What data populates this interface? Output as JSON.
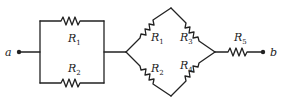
{
  "diagram": {
    "type": "circuit",
    "terminals": [
      {
        "id": "a",
        "label": "a"
      },
      {
        "id": "b",
        "label": "b"
      }
    ],
    "resistors": {
      "left_top": {
        "letter": "R",
        "sub": "1"
      },
      "left_bot": {
        "letter": "R",
        "sub": "2"
      },
      "dia_ul": {
        "letter": "R",
        "sub": "1"
      },
      "dia_ll": {
        "letter": "R",
        "sub": "2"
      },
      "dia_ur": {
        "letter": "R",
        "sub": "3"
      },
      "dia_lr": {
        "letter": "R",
        "sub": "4"
      },
      "series": {
        "letter": "R",
        "sub": "5"
      }
    },
    "colors": {
      "wire": "#222222",
      "background": "#ffffff"
    }
  }
}
